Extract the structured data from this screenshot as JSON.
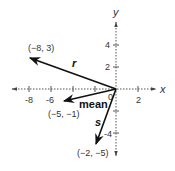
{
  "diagram": {
    "type": "vector-plot",
    "axes": {
      "x_label": "x",
      "y_label": "y",
      "origin_label": "0",
      "x_ticks": [
        {
          "value": -8,
          "label": "-8"
        },
        {
          "value": -6,
          "label": "-6"
        },
        {
          "value": -4,
          "label": ""
        },
        {
          "value": -2,
          "label": ""
        },
        {
          "value": 2,
          "label": "2"
        }
      ],
      "y_ticks": [
        {
          "value": 4,
          "label": "4"
        },
        {
          "value": 2,
          "label": "2"
        },
        {
          "value": -2,
          "label": ""
        },
        {
          "value": -4,
          "label": "-4"
        }
      ]
    },
    "vectors": [
      {
        "name": "r",
        "label": "r",
        "end": [
          -8,
          3
        ],
        "end_label": "(−8, 3)"
      },
      {
        "name": "mean",
        "label": "mean",
        "end": [
          -5,
          -1
        ],
        "end_label": "(−5, −1)"
      },
      {
        "name": "s",
        "label": "s",
        "end": [
          -2,
          -5
        ],
        "end_label": "(−2, −5)"
      }
    ],
    "colors": {
      "vector": "#111111",
      "axis": "#555555",
      "text": "#333333"
    }
  }
}
